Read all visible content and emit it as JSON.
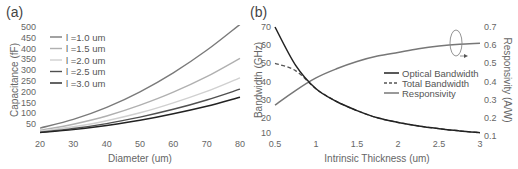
{
  "chart_data": [
    {
      "panel": "(a)",
      "type": "line",
      "title": "",
      "xlabel": "Diameter (um)",
      "ylabel": "Capacitance (fF)",
      "xlim": [
        20,
        80
      ],
      "ylim": [
        0,
        500
      ],
      "xticks": [
        20,
        30,
        40,
        50,
        60,
        70,
        80
      ],
      "yticks": [
        50,
        100,
        150,
        200,
        250,
        300,
        350,
        400,
        450,
        500
      ],
      "grid": false,
      "legend_position": "upper left",
      "x": [
        20,
        30,
        40,
        50,
        60,
        70,
        80
      ],
      "series": [
        {
          "name": "l =1.0 um",
          "color": "#7a7a7a",
          "values": [
            32,
            72,
            128,
            200,
            288,
            392,
            512
          ]
        },
        {
          "name": "l =1.5 um",
          "color": "#b0b0b0",
          "values": [
            22,
            50,
            88,
            138,
            198,
            270,
            355
          ]
        },
        {
          "name": "l =2.0 um",
          "color": "#d0d0d0",
          "values": [
            17,
            38,
            66,
            103,
            149,
            202,
            265
          ]
        },
        {
          "name": "l =2.5 um",
          "color": "#505050",
          "values": [
            13,
            30,
            53,
            83,
            119,
            162,
            212
          ]
        },
        {
          "name": "l =3.0 um",
          "color": "#222222",
          "values": [
            11,
            25,
            44,
            68,
            98,
            133,
            175
          ]
        }
      ]
    },
    {
      "panel": "(b)",
      "type": "line",
      "title": "",
      "xlabel": "Intrinsic Thickness (um)",
      "ylabel": "Bandwidth (GHz)",
      "ylabel_right": "Responsivity (A/W)",
      "xlim": [
        0.5,
        3
      ],
      "ylim": [
        10,
        70
      ],
      "ylim_right": [
        0.1,
        0.7
      ],
      "xticks": [
        0.5,
        1,
        1.5,
        2,
        2.5,
        3
      ],
      "yticks": [
        10,
        20,
        30,
        40,
        50,
        60,
        70
      ],
      "yticks_right": [
        0.1,
        0.2,
        0.3,
        0.4,
        0.5,
        0.6,
        0.7
      ],
      "grid": false,
      "legend_position": "center right",
      "annotation": "ellipse around Responsivity curve near x=2.7 with arrow pointing to right axis",
      "x": [
        0.5,
        0.75,
        1.0,
        1.25,
        1.5,
        1.75,
        2.0,
        2.25,
        2.5,
        2.75,
        3.0
      ],
      "series": [
        {
          "name": "Optical Bandwidth",
          "axis": "left",
          "style": "solid",
          "color": "#222222",
          "values": [
            70,
            49,
            36,
            29,
            24,
            20,
            17.5,
            15.5,
            14,
            12.8,
            11.8
          ]
        },
        {
          "name": "Total  Bandwidth",
          "axis": "left",
          "style": "dashed",
          "color": "#555555",
          "values": [
            50,
            46,
            36,
            29,
            24,
            20,
            17.5,
            15.5,
            14,
            12.8,
            11.8
          ]
        },
        {
          "name": "Responsivity",
          "axis": "right",
          "style": "solid",
          "color": "#777777",
          "values": [
            0.27,
            0.35,
            0.42,
            0.47,
            0.51,
            0.54,
            0.56,
            0.58,
            0.595,
            0.605,
            0.61
          ]
        }
      ]
    }
  ],
  "labels": {
    "panel_a": "(a)",
    "panel_b": "(b)"
  }
}
